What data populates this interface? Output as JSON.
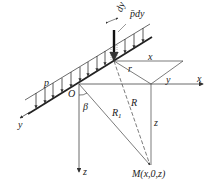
{
  "diagram": {
    "labels": {
      "load_symbol": "p",
      "element_width": "dy",
      "element_load": "p̄dy",
      "origin": "O",
      "angle": "β",
      "x_axis": "x",
      "y_axis": "y",
      "z_axis": "z",
      "x_distance": "x",
      "y_distance": "y",
      "radius_r": "r",
      "distance_R": "R",
      "distance_R1": "R",
      "distance_R1_sub": "1",
      "vertical_z": "z",
      "point_M": "M(x,0,z)"
    },
    "colors": {
      "line": "#333333",
      "text": "#222222",
      "background": "#ffffff"
    }
  }
}
